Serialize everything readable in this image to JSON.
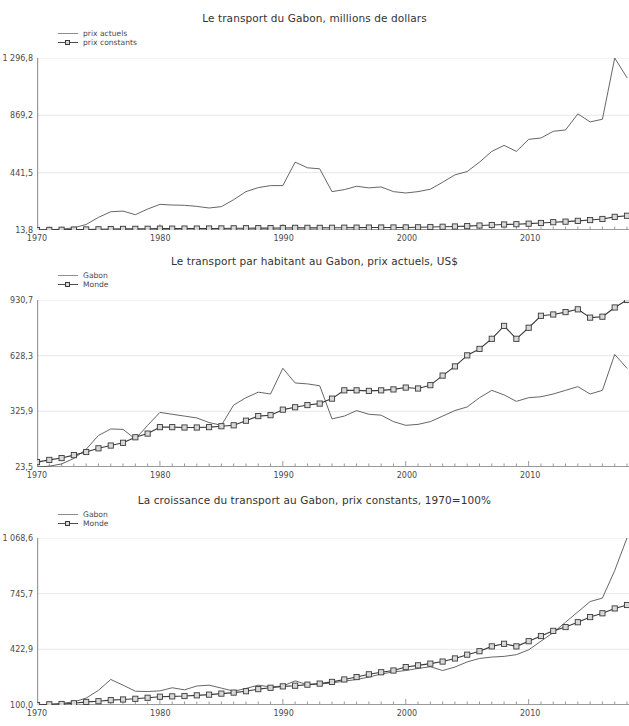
{
  "figure": {
    "background": "#ffffff",
    "text_color": "#333333",
    "series_color_line": "#555555",
    "series_color_marker_line": "#3a3a3a",
    "marker_fill": "#d8d8d8",
    "grid_color": "#e8e8e8",
    "axis_color": "#9a9a9a"
  },
  "charts": [
    {
      "id": "transport-millions-dollars",
      "title": "Le transport du Gabon, millions de dollars",
      "legend": [
        {
          "label": "prix actuels",
          "style": "line"
        },
        {
          "label": "prix constants",
          "style": "line-marker"
        }
      ],
      "yticks": [
        "13,8",
        "441,5",
        "869,2",
        "1 296,8"
      ],
      "xticks": [
        "1970",
        "1980",
        "1990",
        "2000",
        "2010"
      ]
    },
    {
      "id": "transport-par-habitant",
      "title": "Le transport par habitant au Gabon, prix actuels, US$",
      "legend": [
        {
          "label": "Gabon",
          "style": "line"
        },
        {
          "label": "Monde",
          "style": "line-marker"
        }
      ],
      "yticks": [
        "23,5",
        "325,9",
        "628,3",
        "930,7"
      ],
      "xticks": [
        "1970",
        "1980",
        "1990",
        "2000",
        "2010"
      ]
    },
    {
      "id": "croissance-transport",
      "title": "La croissance du transport au Gabon, prix constants, 1970=100%",
      "legend": [
        {
          "label": "Gabon",
          "style": "line"
        },
        {
          "label": "Monde",
          "style": "line-marker"
        }
      ],
      "yticks": [
        "100,0",
        "422,9",
        "745,7",
        "1 068,6"
      ],
      "xticks": [
        "1970",
        "1980",
        "1990",
        "2000",
        "2010"
      ]
    }
  ],
  "chart_data": [
    {
      "type": "line",
      "title": "Le transport du Gabon, millions de dollars",
      "xlabel": "",
      "ylabel": "",
      "grid": true,
      "legend_position": "top-left",
      "ylim": [
        13.8,
        1296.8
      ],
      "yticks": [
        13.8,
        441.5,
        869.2,
        1296.8
      ],
      "ytick_labels": [
        "13,8",
        "441,5",
        "869,2",
        "1 296,8"
      ],
      "xlim": [
        1970,
        2018
      ],
      "xticks": [
        1970,
        1980,
        1990,
        2000,
        2010
      ],
      "xtick_labels": [
        "1970",
        "1980",
        "1990",
        "2000",
        "2010"
      ],
      "x": [
        1970,
        1971,
        1972,
        1973,
        1974,
        1975,
        1976,
        1977,
        1978,
        1979,
        1980,
        1981,
        1982,
        1983,
        1984,
        1985,
        1986,
        1987,
        1988,
        1989,
        1990,
        1991,
        1992,
        1993,
        1994,
        1995,
        1996,
        1997,
        1998,
        1999,
        2000,
        2001,
        2002,
        2003,
        2004,
        2005,
        2006,
        2007,
        2008,
        2009,
        2010,
        2011,
        2012,
        2013,
        2014,
        2015,
        2016,
        2017,
        2018
      ],
      "series": [
        {
          "name": "prix actuels",
          "style": "line",
          "values": [
            13.8,
            16.0,
            20.0,
            30.0,
            55.0,
            108.0,
            150.0,
            155.0,
            128.0,
            170.0,
            205.0,
            200.0,
            198.0,
            190.0,
            178.0,
            188.0,
            240.0,
            300.0,
            330.0,
            345.0,
            345.0,
            520.0,
            478.0,
            470.0,
            300.0,
            315.0,
            340.0,
            328.0,
            335.0,
            300.0,
            290.0,
            300.0,
            318.0,
            370.0,
            425.0,
            450.0,
            520.0,
            600.0,
            645.0,
            600.0,
            690.0,
            700.0,
            750.0,
            760.0,
            880.0,
            820.0,
            840.0,
            1296.8,
            1150.0
          ]
        },
        {
          "name": "prix constants",
          "style": "line-marker",
          "values": [
            13.8,
            14.5,
            15.5,
            17.0,
            18.0,
            19.0,
            21.0,
            22.0,
            22.5,
            23.0,
            24.0,
            24.0,
            24.5,
            24.5,
            25.0,
            25.5,
            26.5,
            27.0,
            27.5,
            28.0,
            29.0,
            30.0,
            30.0,
            30.0,
            30.5,
            31.0,
            31.5,
            32.0,
            32.5,
            32.5,
            33.0,
            34.0,
            36.0,
            38.0,
            40.0,
            43.0,
            47.0,
            51.0,
            55.0,
            57.0,
            61.0,
            66.0,
            72.0,
            76.0,
            82.0,
            88.0,
            96.0,
            112.0,
            120.0
          ]
        }
      ]
    },
    {
      "type": "line",
      "title": "Le transport par habitant au Gabon, prix actuels, US$",
      "xlabel": "",
      "ylabel": "",
      "grid": true,
      "legend_position": "top-left",
      "ylim": [
        23.5,
        930.7
      ],
      "yticks": [
        23.5,
        325.9,
        628.3,
        930.7
      ],
      "ytick_labels": [
        "23,5",
        "325,9",
        "628,3",
        "930,7"
      ],
      "xlim": [
        1970,
        2018
      ],
      "xticks": [
        1970,
        1980,
        1990,
        2000,
        2010
      ],
      "xtick_labels": [
        "1970",
        "1980",
        "1990",
        "2000",
        "2010"
      ],
      "x": [
        1970,
        1971,
        1972,
        1973,
        1974,
        1975,
        1976,
        1977,
        1978,
        1979,
        1980,
        1981,
        1982,
        1983,
        1984,
        1985,
        1986,
        1987,
        1988,
        1989,
        1990,
        1991,
        1992,
        1993,
        1994,
        1995,
        1996,
        1997,
        1998,
        1999,
        2000,
        2001,
        2002,
        2003,
        2004,
        2005,
        2006,
        2007,
        2008,
        2009,
        2010,
        2011,
        2012,
        2013,
        2014,
        2015,
        2016,
        2017,
        2018
      ],
      "series": [
        {
          "name": "Gabon",
          "style": "line",
          "values": [
            23.5,
            28.0,
            40.0,
            70.0,
            120.0,
            195.0,
            230.0,
            228.0,
            175.0,
            250.0,
            320.0,
            310.0,
            300.0,
            290.0,
            265.0,
            250.0,
            360.0,
            400.0,
            430.0,
            420.0,
            560.0,
            480.0,
            475.0,
            465.0,
            285.0,
            300.0,
            330.0,
            310.0,
            305.0,
            270.0,
            250.0,
            255.0,
            270.0,
            300.0,
            330.0,
            350.0,
            400.0,
            440.0,
            415.0,
            380.0,
            400.0,
            405.0,
            420.0,
            440.0,
            460.0,
            420.0,
            440.0,
            635.0,
            560.0
          ]
        },
        {
          "name": "Monde",
          "style": "line-marker",
          "values": [
            50.0,
            62.0,
            72.0,
            88.0,
            105.0,
            125.0,
            140.0,
            155.0,
            185.0,
            205.0,
            240.0,
            240.0,
            238.0,
            238.0,
            240.0,
            245.0,
            250.0,
            275.0,
            300.0,
            305.0,
            335.0,
            348.0,
            360.0,
            368.0,
            395.0,
            440.0,
            440.0,
            437.0,
            440.0,
            445.0,
            455.0,
            450.0,
            468.0,
            520.0,
            570.0,
            630.0,
            665.0,
            720.0,
            790.0,
            720.0,
            780.0,
            845.0,
            852.0,
            865.0,
            880.0,
            835.0,
            840.0,
            890.0,
            930.7
          ]
        }
      ]
    },
    {
      "type": "line",
      "title": "La croissance du transport au Gabon, prix constants, 1970=100%",
      "xlabel": "",
      "ylabel": "",
      "grid": true,
      "legend_position": "top-left",
      "ylim": [
        100.0,
        1068.6
      ],
      "yticks": [
        100.0,
        422.9,
        745.7,
        1068.6
      ],
      "ytick_labels": [
        "100,0",
        "422,9",
        "745,7",
        "1 068,6"
      ],
      "xlim": [
        1970,
        2018
      ],
      "xticks": [
        1970,
        1980,
        1990,
        2000,
        2010
      ],
      "xtick_labels": [
        "1970",
        "1980",
        "1990",
        "2000",
        "2010"
      ],
      "x": [
        1970,
        1971,
        1972,
        1973,
        1974,
        1975,
        1976,
        1977,
        1978,
        1979,
        1980,
        1981,
        1982,
        1983,
        1984,
        1985,
        1986,
        1987,
        1988,
        1989,
        1990,
        1991,
        1992,
        1993,
        1994,
        1995,
        1996,
        1997,
        1998,
        1999,
        2000,
        2001,
        2002,
        2003,
        2004,
        2005,
        2006,
        2007,
        2008,
        2009,
        2010,
        2011,
        2012,
        2013,
        2014,
        2015,
        2016,
        2017,
        2018
      ],
      "series": [
        {
          "name": "Gabon",
          "style": "line",
          "values": [
            100.0,
            104.0,
            110.0,
            118.0,
            140.0,
            185.0,
            248.0,
            215.0,
            180.0,
            178.0,
            182.0,
            200.0,
            188.0,
            210.0,
            215.0,
            198.0,
            180.0,
            196.0,
            215.0,
            205.0,
            210.0,
            240.0,
            218.0,
            222.0,
            228.0,
            238.0,
            248.0,
            262.0,
            280.0,
            292.0,
            300.0,
            312.0,
            322.0,
            300.0,
            320.0,
            350.0,
            370.0,
            378.0,
            382.0,
            392.0,
            420.0,
            470.0,
            520.0,
            580.0,
            640.0,
            700.0,
            720.0,
            880.0,
            1068.6
          ]
        },
        {
          "name": "Monde",
          "style": "line-marker",
          "values": [
            100.0,
            104.0,
            106.0,
            110.0,
            118.0,
            122.0,
            128.0,
            132.0,
            136.0,
            142.0,
            148.0,
            150.0,
            152.0,
            156.0,
            160.0,
            166.0,
            172.0,
            180.0,
            192.0,
            200.0,
            208.0,
            212.0,
            218.0,
            224.0,
            234.0,
            248.0,
            262.0,
            278.0,
            290.0,
            300.0,
            320.0,
            330.0,
            340.0,
            352.0,
            370.0,
            392.0,
            412.0,
            440.0,
            455.0,
            440.0,
            470.0,
            500.0,
            530.0,
            552.0,
            580.0,
            610.0,
            632.0,
            660.0,
            680.0
          ]
        }
      ]
    }
  ]
}
